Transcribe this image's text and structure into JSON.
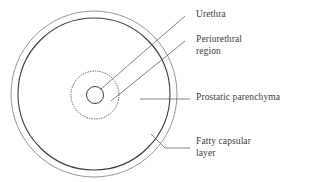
{
  "figure": {
    "background_color": "#ffffff",
    "stroke_color": "#4a4a4a",
    "text_color": "#3b3b3b"
  },
  "labels": {
    "urethra": "Urethra",
    "periurethral_line1": "Periurethral",
    "periurethral_line2": "region",
    "prostatic_parenchyma": "Prostatic parenchyma",
    "fatty_line1": "Fatty capsular",
    "fatty_line2": "layer"
  },
  "shapes": {
    "outer_capsule": {
      "name": "fatty-capsular-layer-circle",
      "cx": 94,
      "cy": 94,
      "r": 83,
      "stroke": "#8a8a8a",
      "stroke_width": 0.9,
      "style": "solid"
    },
    "inner_capsule": {
      "name": "prostatic-parenchyma-circle",
      "cx": 94,
      "cy": 94,
      "r": 76,
      "stroke": "#3d3d3d",
      "stroke_width": 1.1,
      "style": "solid"
    },
    "periurethral_region": {
      "name": "periurethral-region-circle",
      "cx": 95,
      "cy": 95,
      "r": 24,
      "stroke": "#4a4a4a",
      "stroke_width": 0.9,
      "style": "dotted"
    },
    "urethra": {
      "name": "urethra-circle",
      "cx": 95,
      "cy": 95,
      "r": 8.5,
      "stroke": "#3d3d3d",
      "stroke_width": 1.0,
      "style": "solid"
    }
  },
  "leader_lines": [
    {
      "name": "urethra-leader",
      "points": "101,89 185,16"
    },
    {
      "name": "periurethral-leader",
      "points": "111,101 185,41"
    },
    {
      "name": "prostatic-parenchyma-leader",
      "points": "140,99 190,99"
    },
    {
      "name": "fatty-capsular-leader",
      "points": "151,134 165,148 190,148"
    }
  ]
}
